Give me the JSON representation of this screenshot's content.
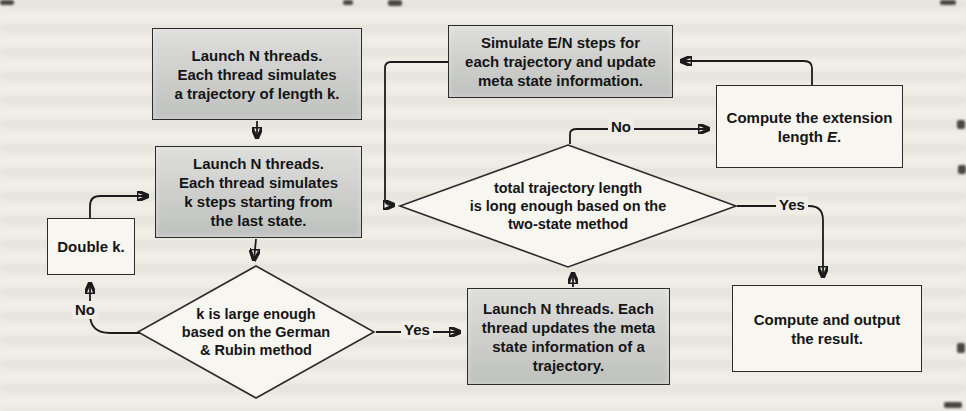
{
  "flowchart": {
    "title": "",
    "nodes": {
      "launch_trajectory": {
        "lines": [
          "Launch N threads.",
          "Each thread simulates",
          "a trajectory of length k."
        ]
      },
      "simulate_steps": {
        "lines": [
          "Simulate E/N steps for",
          "each trajectory and update",
          "meta state information."
        ]
      },
      "launch_k_steps": {
        "lines": [
          "Launch N threads.",
          "Each thread simulates",
          "k steps starting from",
          "the last state."
        ]
      },
      "double_k": {
        "lines": [
          "Double k."
        ]
      },
      "compute_extension": {
        "line1": "Compute the extension",
        "line2_prefix": "length ",
        "line2_emphasis": "E",
        "line2_suffix": "."
      },
      "launch_update": {
        "lines": [
          "Launch N threads. Each",
          "thread updates the meta",
          "state information of a",
          "trajectory."
        ]
      },
      "compute_output": {
        "lines": [
          "Compute and output",
          "the result."
        ]
      },
      "decision_german_rubin": {
        "lines": [
          "k is large enough",
          "based on the German",
          "& Rubin method"
        ]
      },
      "decision_two_state": {
        "lines": [
          "total trajectory length",
          "is long enough based on the",
          "two-state method"
        ]
      }
    },
    "labels": {
      "no_left": "No",
      "yes_left": "Yes",
      "no_right": "No",
      "yes_right": "Yes"
    },
    "colors": {
      "page_background": "#f0ede7",
      "process_fill_top": "#dededc",
      "process_fill_bottom": "#bfc1bf",
      "plain_fill": "#f8f6f1",
      "border": "#2b2b2b",
      "line": "#1b1b1b",
      "text": "#151515"
    }
  }
}
